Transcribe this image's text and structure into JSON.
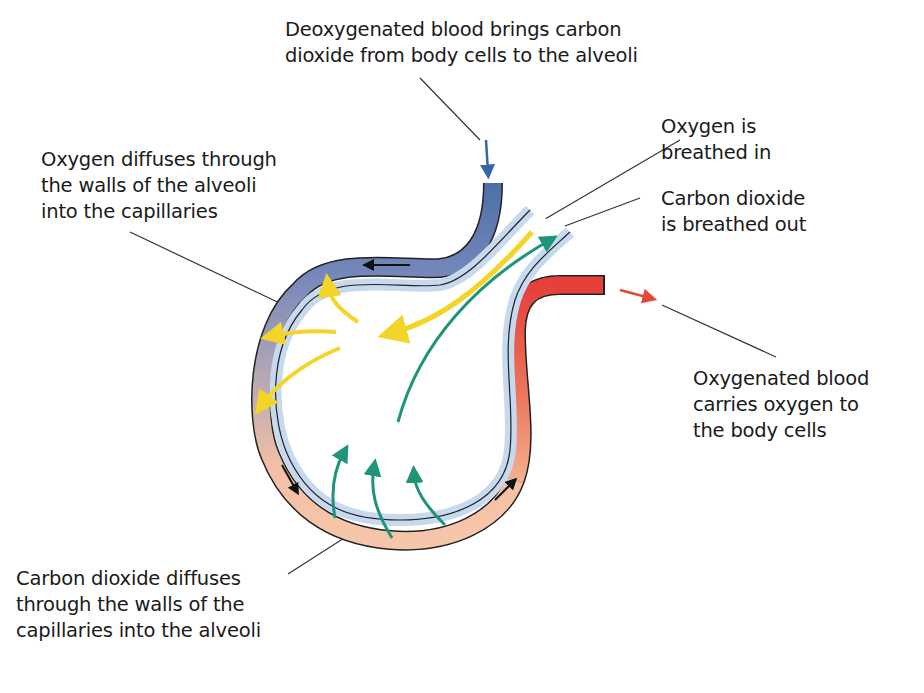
{
  "diagram": {
    "labels": {
      "deoxygenated_blood": "Deoxygenated blood brings carbon\ndioxide from body cells to the alveoli",
      "oxygen_diffuses": "Oxygen diffuses through\nthe walls of the alveoli\ninto the capillaries",
      "oxygen_in": "Oxygen is\nbreathed in",
      "co2_out": "Carbon dioxide\nis breathed out",
      "oxygenated_blood": "Oxygenated blood\ncarries oxygen to\nthe body cells",
      "co2_diffuses": "Carbon dioxide diffuses\nthrough the walls of the\ncapillaries into the alveoli"
    },
    "colors": {
      "deoxygenated": "#3a64a8",
      "oxygenated": "#e5473b",
      "capillary_mid": "#a9a3b3",
      "capillary_bottom": "#f6c1a6",
      "alveolus_wall": "#c7d9ee",
      "oxygen_arrow": "#f5d428",
      "co2_arrow": "#1e9478",
      "leader_line": "#333333"
    }
  }
}
